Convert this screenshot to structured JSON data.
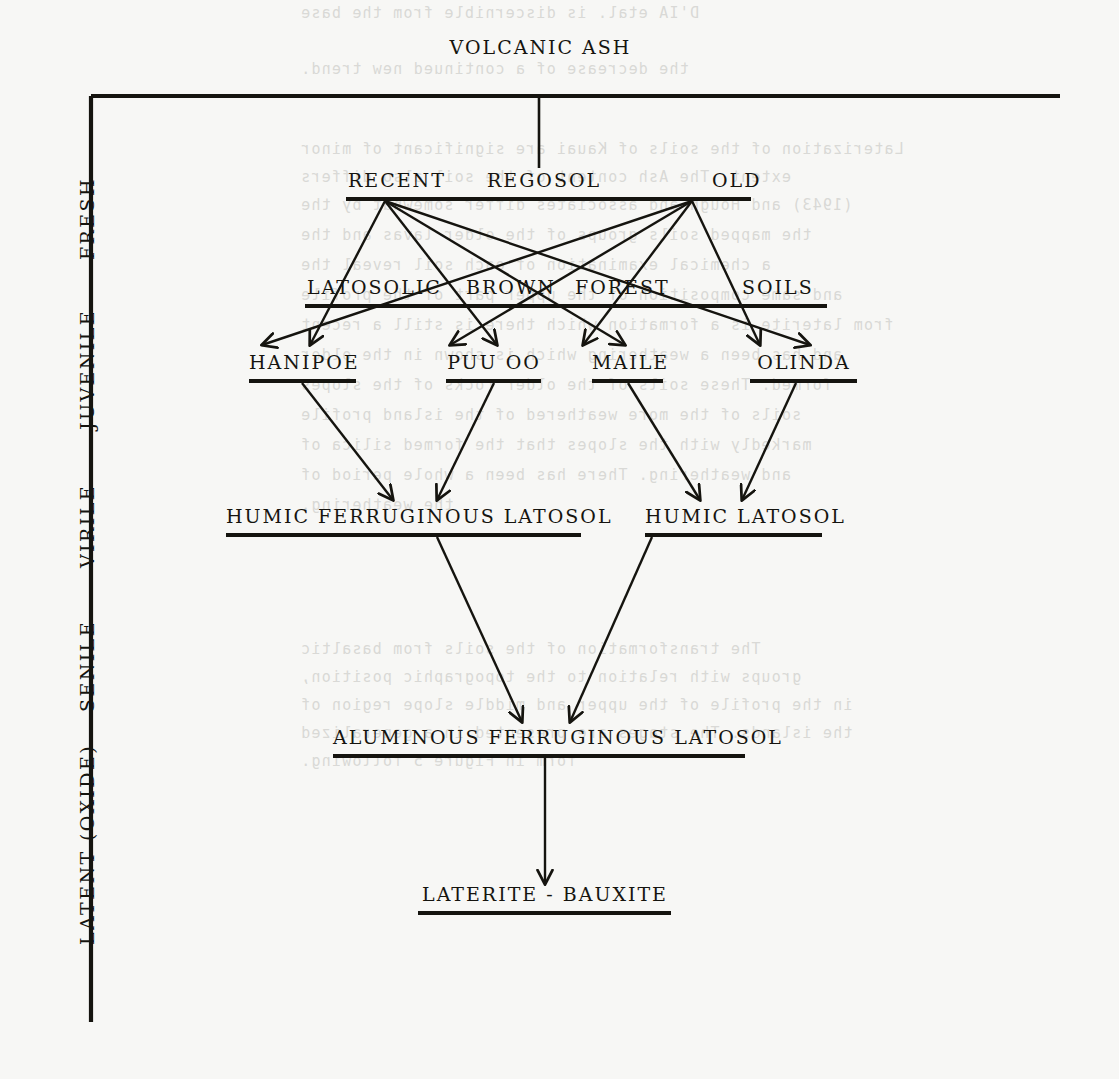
{
  "diagram": {
    "title": "VOLCANIC ASH",
    "axis": {
      "name": "weathering-stage-axis",
      "stages": [
        {
          "label": "FRESH",
          "y": 215
        },
        {
          "label": "JUVENILE",
          "y": 380
        },
        {
          "label": "VIRILE",
          "y": 530
        },
        {
          "label": "SENILE",
          "y": 665
        },
        {
          "label": "LATENT (OXIDE)",
          "y": 845
        }
      ]
    },
    "tiers": [
      {
        "name": "tier-regosol",
        "labels": [
          "RECENT",
          "REGOSOL",
          "OLD"
        ],
        "text": "RECENT     REGOSOL          OLD"
      },
      {
        "name": "tier-latosolic-brown-forest-soils",
        "labels": [
          "LATOSOLIC",
          "BROWN",
          "FOREST",
          "SOILS"
        ],
        "text": "LATOSOLIC   BROWN   FOREST      SOILS"
      },
      {
        "name": "tier-soil-series",
        "labels": [
          "HANIPOE",
          "PUU OO",
          "MAILE",
          "OLINDA"
        ]
      },
      {
        "name": "tier-humic-latosols",
        "labels": [
          "HUMIC FERRUGINOUS LATOSOL",
          "HUMIC LATOSOL"
        ]
      },
      {
        "name": "tier-aluminous",
        "labels": [
          "ALUMINOUS FERRUGINOUS LATOSOL"
        ]
      },
      {
        "name": "tier-end-member",
        "labels": [
          "LATERITE - BAUXITE"
        ]
      }
    ],
    "nodes": {
      "volcanic_ash": "VOLCANIC ASH",
      "recent": "RECENT",
      "regosol": "REGOSOL",
      "old": "OLD",
      "latosolic": "LATOSOLIC",
      "brown": "BROWN",
      "forest": "FOREST",
      "soils": "SOILS",
      "hanipoe": "HANIPOE",
      "puu_oo": "PUU OO",
      "maile": "MAILE",
      "olinda": "OLINDA",
      "humic_ferruginous_latosol": "HUMIC FERRUGINOUS LATOSOL",
      "humic_latosol": "HUMIC LATOSOL",
      "aluminous_ferruginous_latosol": "ALUMINOUS FERRUGINOUS LATOSOL",
      "laterite_bauxite": "LATERITE - BAUXITE"
    },
    "edges": [
      {
        "from": "VOLCANIC ASH",
        "to": "REGOSOL",
        "arrow": false
      },
      {
        "from": "RECENT",
        "to": "HANIPOE",
        "arrow": true
      },
      {
        "from": "RECENT",
        "to": "PUU OO",
        "arrow": true
      },
      {
        "from": "RECENT",
        "to": "MAILE",
        "arrow": true
      },
      {
        "from": "RECENT",
        "to": "OLINDA",
        "arrow": true
      },
      {
        "from": "OLD",
        "to": "HANIPOE",
        "arrow": true
      },
      {
        "from": "OLD",
        "to": "PUU OO",
        "arrow": true
      },
      {
        "from": "OLD",
        "to": "MAILE",
        "arrow": true
      },
      {
        "from": "OLD",
        "to": "OLINDA",
        "arrow": true
      },
      {
        "from": "HANIPOE",
        "to": "HUMIC FERRUGINOUS LATOSOL",
        "arrow": true
      },
      {
        "from": "PUU OO",
        "to": "HUMIC FERRUGINOUS LATOSOL",
        "arrow": true
      },
      {
        "from": "MAILE",
        "to": "HUMIC LATOSOL",
        "arrow": true
      },
      {
        "from": "OLINDA",
        "to": "HUMIC LATOSOL",
        "arrow": true
      },
      {
        "from": "HUMIC FERRUGINOUS LATOSOL",
        "to": "ALUMINOUS FERRUGINOUS LATOSOL",
        "arrow": true
      },
      {
        "from": "HUMIC LATOSOL",
        "to": "ALUMINOUS FERRUGINOUS LATOSOL",
        "arrow": true
      },
      {
        "from": "ALUMINOUS FERRUGINOUS LATOSOL",
        "to": "LATERITE - BAUXITE",
        "arrow": true
      }
    ],
    "colors": {
      "ink": "#15140f",
      "paper": "#f7f7f5",
      "bleed": "#d9d9d6"
    }
  },
  "bleed_through": {
    "lines": [
      {
        "text": "D'IA etal. is discernible from the base",
        "x": 300,
        "y": 4
      },
      {
        "text": "the decrease of a continued new trend.",
        "x": 300,
        "y": 60
      },
      {
        "text": "Laterization of the soils of Kauai are significant of minor",
        "x": 300,
        "y": 140
      },
      {
        "text": "extent. The Ash content of the soil also differs",
        "x": 300,
        "y": 168
      },
      {
        "text": "(1943) and Hough and associates differ somewhat by the",
        "x": 300,
        "y": 196
      },
      {
        "text": "the mapped soils groups of the older lavas and the",
        "x": 300,
        "y": 226
      },
      {
        "text": "a chemical examination of each soil reveal the",
        "x": 300,
        "y": 256
      },
      {
        "text": "and same composition of the upper part of the profile",
        "x": 300,
        "y": 286
      },
      {
        "text": "from laterite is a formation which there is still a recent",
        "x": 300,
        "y": 316
      },
      {
        "text": "and has been a weathering which is shown in the older",
        "x": 300,
        "y": 346
      },
      {
        "text": "formed. These soils of the older rocks of the slopes",
        "x": 300,
        "y": 376
      },
      {
        "text": "soils of the more weathered of the island profile",
        "x": 300,
        "y": 406
      },
      {
        "text": "markedly with the slopes that the formed silica of",
        "x": 300,
        "y": 436
      },
      {
        "text": "and weathering. There has been a whole period of",
        "x": 300,
        "y": 466
      },
      {
        "text": "the weathering.",
        "x": 300,
        "y": 496
      },
      {
        "text": "The transformation of the soils from basaltic",
        "x": 300,
        "y": 640
      },
      {
        "text": "groups with relation to the topographic position,",
        "x": 300,
        "y": 668
      },
      {
        "text": "in the profile of the upper and middle slope region of",
        "x": 300,
        "y": 696
      },
      {
        "text": "the islands. The stages are presented in a generalized",
        "x": 300,
        "y": 724
      },
      {
        "text": "form in Figure 5 following.",
        "x": 300,
        "y": 752
      }
    ]
  }
}
